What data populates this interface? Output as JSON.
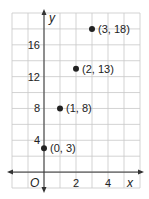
{
  "chart_data": {
    "type": "scatter",
    "title": "",
    "xlabel": "x",
    "ylabel": "y",
    "origin_label": "O",
    "xlim": [
      -2,
      6
    ],
    "ylim": [
      -2,
      20
    ],
    "grid": true,
    "x_ticks": [
      2,
      4
    ],
    "y_ticks": [
      4,
      8,
      12,
      16
    ],
    "series": [
      {
        "name": "points",
        "points": [
          {
            "x": 0,
            "y": 3,
            "label": "(0, 3)"
          },
          {
            "x": 1,
            "y": 8,
            "label": "(1, 8)"
          },
          {
            "x": 2,
            "y": 13,
            "label": "(2, 13)"
          },
          {
            "x": 3,
            "y": 18,
            "label": "(3, 18)"
          }
        ]
      }
    ]
  },
  "colors": {
    "grid": "#c8c8c8",
    "axis": "#333333",
    "point": "#222222",
    "text": "#222222"
  }
}
